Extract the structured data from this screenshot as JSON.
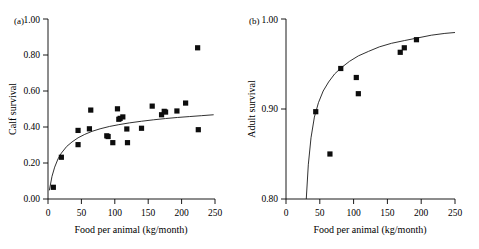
{
  "figure": {
    "background": "#ffffff",
    "point_color": "#0d0d0d",
    "curve_color": "#1a1a1a",
    "axis_color": "#000000"
  },
  "chart_data": [
    {
      "type": "scatter",
      "panel_tag": "(a)",
      "title": "",
      "xlabel": "Food per animal (kg/month)",
      "ylabel": "Calf survival",
      "xlim": [
        0,
        250
      ],
      "ylim": [
        0.0,
        1.0
      ],
      "xticks": [
        0,
        50,
        100,
        150,
        200,
        250
      ],
      "xtick_labels": [
        "0",
        "50",
        "100",
        "150",
        "200",
        "250"
      ],
      "yticks": [
        0.0,
        0.2,
        0.4,
        0.6,
        0.8,
        1.0
      ],
      "ytick_labels": [
        "0.00",
        "0.20",
        "0.40",
        "0.60",
        "0.80",
        "1.00"
      ],
      "grid": false,
      "legend": false,
      "marker": "square",
      "x": [
        8,
        20,
        45,
        45,
        62,
        64,
        88,
        90,
        97,
        104,
        106,
        108,
        112,
        118,
        119,
        140,
        156,
        170,
        174,
        176,
        193,
        206,
        224,
        225
      ],
      "y": [
        0.065,
        0.232,
        0.381,
        0.302,
        0.39,
        0.494,
        0.351,
        0.347,
        0.313,
        0.501,
        0.443,
        0.448,
        0.456,
        0.389,
        0.313,
        0.393,
        0.516,
        0.468,
        0.487,
        0.483,
        0.489,
        0.533,
        0.84,
        0.385
      ],
      "fit_curve": {
        "form": "saturating",
        "description": "Monotonic saturating curve rising from 0 at x=0 to about 0.47 at x=250",
        "points_x": [
          2,
          6,
          10,
          15,
          20,
          28,
          36,
          45,
          55,
          66,
          78,
          92,
          106,
          122,
          140,
          158,
          176,
          194,
          212,
          230,
          248
        ],
        "points_y": [
          0.048,
          0.126,
          0.177,
          0.223,
          0.255,
          0.292,
          0.317,
          0.34,
          0.359,
          0.376,
          0.39,
          0.403,
          0.413,
          0.423,
          0.432,
          0.44,
          0.447,
          0.453,
          0.458,
          0.463,
          0.468
        ]
      }
    },
    {
      "type": "scatter",
      "panel_tag": "(b)",
      "title": "",
      "xlabel": "Food per animal (kg/month)",
      "ylabel": "Adult survival",
      "xlim": [
        0,
        250
      ],
      "ylim": [
        0.8,
        1.0
      ],
      "xticks": [
        0,
        50,
        100,
        150,
        200,
        250
      ],
      "xtick_labels": [
        "0",
        "50",
        "100",
        "150",
        "200",
        "250"
      ],
      "yticks": [
        0.8,
        0.9,
        1.0
      ],
      "ytick_labels": [
        "0.80",
        "0.90",
        "1.00"
      ],
      "grid": false,
      "legend": false,
      "marker": "square",
      "x": [
        44,
        65,
        81,
        104,
        107,
        169,
        175,
        193
      ],
      "y": [
        0.897,
        0.85,
        0.945,
        0.935,
        0.917,
        0.963,
        0.968,
        0.977
      ],
      "fit_curve": {
        "form": "saturating",
        "description": "Steeply rising saturating curve starting near x=30 at y=0.80 approaching about 0.985 at x=250",
        "points_x": [
          30,
          33,
          37,
          42,
          48,
          55,
          63,
          72,
          82,
          94,
          107,
          122,
          138,
          156,
          175,
          195,
          215,
          235,
          250
        ],
        "points_y": [
          0.8,
          0.838,
          0.868,
          0.891,
          0.907,
          0.92,
          0.93,
          0.939,
          0.946,
          0.953,
          0.959,
          0.964,
          0.969,
          0.973,
          0.976,
          0.979,
          0.982,
          0.984,
          0.985
        ]
      }
    }
  ]
}
